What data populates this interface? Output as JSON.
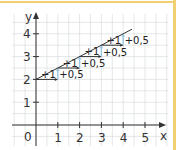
{
  "chart_data": {
    "type": "line",
    "title": "",
    "xlabel": "x",
    "ylabel": "y",
    "origin_label": "0",
    "x_ticks": [
      "1",
      "2",
      "3",
      "4",
      "5"
    ],
    "y_ticks": [
      "1",
      "2",
      "3",
      "4"
    ],
    "xlim": [
      0,
      5.5
    ],
    "ylim": [
      0,
      4.5
    ],
    "grid": true,
    "line": {
      "x": [
        0,
        4.4
      ],
      "y": [
        2,
        4.2
      ],
      "slope": 0.5,
      "intercept": 2
    },
    "steps": [
      {
        "x_start": 0,
        "y_start": 2,
        "run_label": "+1",
        "rise_label": "+0,5"
      },
      {
        "x_start": 1,
        "y_start": 2.5,
        "run_label": "+1",
        "rise_label": "+0,5"
      },
      {
        "x_start": 2,
        "y_start": 3,
        "run_label": "+1",
        "rise_label": "+0,5"
      },
      {
        "x_start": 3,
        "y_start": 3.5,
        "run_label": "+1",
        "rise_label": "+0,5"
      }
    ],
    "colors": {
      "grid": "#d8dce0",
      "axis": "#333333",
      "line": "#333333",
      "rise_arrow": "#9cc8e6",
      "border": "#f0d070"
    }
  }
}
